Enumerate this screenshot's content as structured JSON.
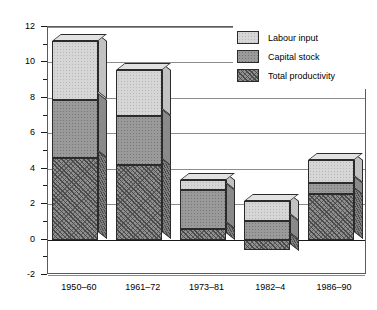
{
  "chart_data": {
    "type": "bar",
    "subtype": "stacked-bar-3d",
    "title": "",
    "xlabel": "",
    "ylabel": "Annual rate of change (%)",
    "ylim": [
      -2,
      12
    ],
    "ytick_labels": [
      "12",
      "10",
      "8",
      "6",
      "4",
      "2",
      "0",
      "-2"
    ],
    "ytick_values": [
      12,
      10,
      8,
      6,
      4,
      2,
      0,
      -2
    ],
    "yminor_values": [
      11,
      9,
      7,
      5,
      3,
      1,
      -1
    ],
    "grid": true,
    "grid_axis": "y",
    "legend_position": "top-right",
    "categories": [
      "1950–60",
      "1961–72",
      "1973–81",
      "1982–4",
      "1986–90"
    ],
    "series": [
      {
        "name": "Total productivity",
        "pattern": "diagonal-hatch",
        "values": [
          4.6,
          4.2,
          0.6,
          -0.6,
          2.55
        ]
      },
      {
        "name": "Capital stock",
        "pattern": "dark-dots",
        "values": [
          3.3,
          2.8,
          2.2,
          1.05,
          0.65
        ]
      },
      {
        "name": "Labour input",
        "pattern": "light-dots",
        "values": [
          3.3,
          2.6,
          0.55,
          1.15,
          1.3
        ]
      }
    ],
    "stack_tops": [
      11.2,
      9.6,
      3.35,
      2.2,
      4.5
    ],
    "stack_boundaries": [
      {
        "category": "1950–60",
        "total_productivity_top": 4.6,
        "capital_top": 7.9,
        "labour_top": 11.2
      },
      {
        "category": "1961–72",
        "total_productivity_top": 4.2,
        "capital_top": 7.0,
        "labour_top": 9.6
      },
      {
        "category": "1973–81",
        "total_productivity_top": 0.6,
        "capital_top": 2.8,
        "labour_top": 3.35
      },
      {
        "category": "1982–4",
        "total_productivity_top": -0.6,
        "capital_top": 1.05,
        "labour_top": 2.2
      },
      {
        "category": "1986–90",
        "total_productivity_top": 2.55,
        "capital_top": 3.2,
        "labour_top": 4.5
      }
    ]
  },
  "legend": {
    "items": [
      {
        "label": "Labour input",
        "key": "labour"
      },
      {
        "label": "Capital stock",
        "key": "capital"
      },
      {
        "label": "Total productivity",
        "key": "total"
      }
    ]
  },
  "colors": {
    "labour_fill": "#d6d6d6",
    "capital_fill": "#9a9a9a",
    "total_fill": "#8f8f8f",
    "outline": "#2b2b2b",
    "gridline": "#8c8c8c",
    "frame": "#5a5a5a",
    "text": "#000000",
    "background": "#ffffff"
  }
}
